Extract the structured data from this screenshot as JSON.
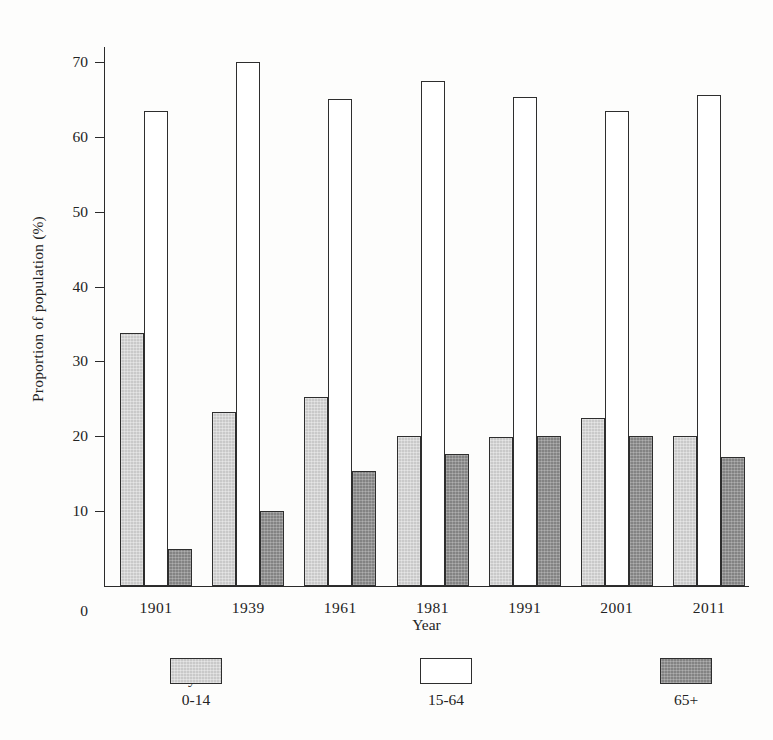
{
  "chart_data": {
    "type": "bar",
    "title": "",
    "xlabel": "Year",
    "ylabel": "Proportion of population (%)",
    "categories": [
      "1901",
      "1939",
      "1961",
      "1981",
      "1991",
      "2001",
      "2011"
    ],
    "series": [
      {
        "name": "0-14",
        "color": "#c9c9c9",
        "values": [
          33.8,
          23.2,
          25.3,
          20.1,
          19.9,
          22.5,
          20.0
        ]
      },
      {
        "name": "15-64",
        "color": "#ffffff",
        "values": [
          63.4,
          70.0,
          65.0,
          67.4,
          65.3,
          63.4,
          65.6
        ]
      },
      {
        "name": "65+",
        "color": "#838383",
        "values": [
          5.0,
          10.0,
          15.4,
          17.6,
          20.0,
          20.1,
          17.3
        ]
      }
    ],
    "ylim": [
      0,
      72
    ],
    "yticks": [
      0,
      10,
      20,
      30,
      40,
      50,
      60,
      70
    ],
    "ytick_labels": [
      "0",
      "10",
      "20",
      "30",
      "40",
      "50",
      "60",
      "70"
    ],
    "grid": false,
    "legend_position": "below-axis",
    "legend_title": "Key"
  }
}
